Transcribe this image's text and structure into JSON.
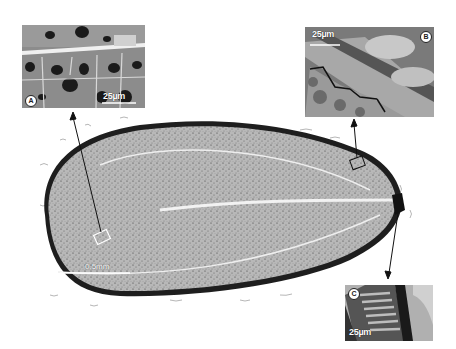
{
  "figure": {
    "main_section": {
      "scale_bar_label": "0.5mm",
      "colors": {
        "tissue": "#b4b4b4",
        "seed_coat": "#1e1e1e",
        "background": "#ffffff",
        "highlight": "#f2f2f2"
      }
    },
    "panels": [
      {
        "id": "A",
        "badge": "A",
        "scale_bar_label": "25µm",
        "region": "endosperm cells"
      },
      {
        "id": "B",
        "badge": "B",
        "scale_bar_label": "25µm",
        "region": "seed coat / endosperm boundary"
      },
      {
        "id": "C",
        "badge": "C",
        "scale_bar_label": "25µm",
        "region": "micropylar end"
      }
    ]
  }
}
